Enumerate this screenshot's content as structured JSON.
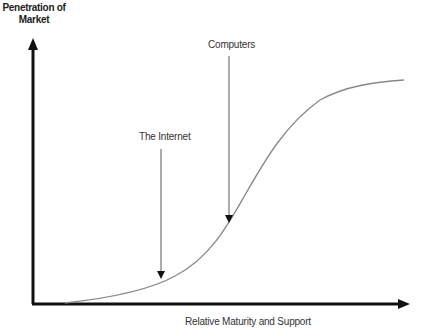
{
  "diagram": {
    "y_axis_label": "Penetration of Market",
    "y_axis_label_line1": "Penetration of",
    "y_axis_label_line2": "Market",
    "x_axis_label": "Relative Maturity and Support",
    "curve_type": "s-curve",
    "annotations": [
      {
        "label": "The Internet",
        "points_to": "early adoption phase"
      },
      {
        "label": "Computers",
        "points_to": "steep growth phase"
      }
    ],
    "colors": {
      "axis": "#111111",
      "curve": "#888888",
      "annotation_arrow": "#777777",
      "text": "#222222"
    }
  }
}
